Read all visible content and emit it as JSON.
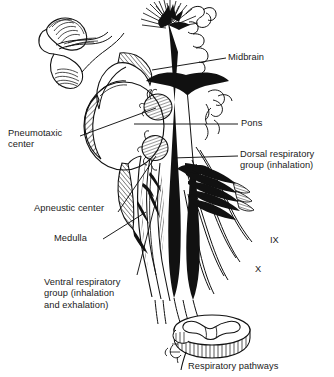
{
  "figure": {
    "title": "Respiratory pathways",
    "background_color": "#ffffff",
    "ink_color": "#111111",
    "text_color": "#1a1a1a"
  },
  "labels": {
    "midbrain": "Midbrain",
    "pons": "Pons",
    "dorsal_respiratory_group_line1": "Dorsal respiratory",
    "dorsal_respiratory_group_line2": "group (inhalation)",
    "pneumotaxic_center_line1": "Pneumotaxic",
    "pneumotaxic_center_line2": "center",
    "apneustic_center": "Apneustic center",
    "medulla": "Medulla",
    "ventral_respiratory_group_line1": "Ventral respiratory",
    "ventral_respiratory_group_line2": "group (inhalation",
    "ventral_respiratory_group_line3": "and exhalation)",
    "caption": "Respiratory pathways"
  },
  "nerves": {
    "glossopharyngeal": "IX",
    "vagus": "X"
  },
  "anatomy_parts": [
    "midbrain",
    "pons",
    "medulla",
    "pneumotaxic-center",
    "apneustic-center",
    "dorsal-respiratory-group",
    "ventral-respiratory-group",
    "cranial-nerve-ix",
    "cranial-nerve-x",
    "spinal-cord-cross-section",
    "cerebellum"
  ]
}
